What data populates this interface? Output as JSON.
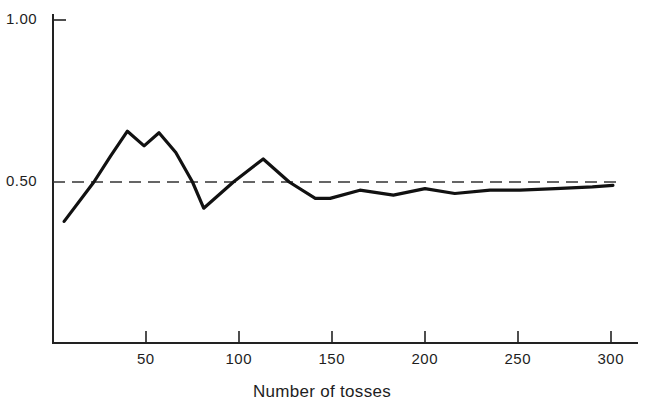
{
  "chart_data": {
    "type": "line",
    "title": "",
    "xlabel": "Number of tosses",
    "ylabel": "",
    "xlim": [
      0,
      310
    ],
    "ylim": [
      0,
      1.0
    ],
    "x_ticks": [
      50,
      100,
      150,
      200,
      250,
      300
    ],
    "x_tick_labels": [
      "50",
      "100",
      "150",
      "200",
      "250",
      "300"
    ],
    "y_ticks": [
      0.5,
      1.0
    ],
    "y_tick_labels": [
      "0.50",
      "1.00"
    ],
    "grid": false,
    "legend": null,
    "reference_line": {
      "y": 0.5,
      "style": "dashed"
    },
    "series": [
      {
        "name": "Proportion of heads",
        "x": [
          6,
          22,
          31,
          40,
          49,
          57,
          66,
          75,
          81,
          97,
          113,
          127,
          141,
          149,
          165,
          183,
          200,
          216,
          235,
          251,
          270,
          290,
          301
        ],
        "values": [
          0.38,
          0.5,
          0.58,
          0.655,
          0.61,
          0.65,
          0.59,
          0.5,
          0.42,
          0.5,
          0.57,
          0.5,
          0.45,
          0.45,
          0.475,
          0.46,
          0.48,
          0.465,
          0.475,
          0.475,
          0.48,
          0.485,
          0.49
        ]
      }
    ]
  }
}
